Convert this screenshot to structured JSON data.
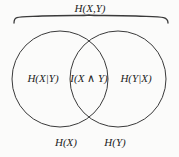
{
  "figure": {
    "type": "venn-diagram",
    "topic": "information-theory-entropy",
    "background_color": "#fbfbfa",
    "stroke_color": "#3a3a3a",
    "text_color": "#1d1d1d"
  },
  "labels": {
    "joint_entropy": "H(X,Y)",
    "conditional_x_given_y": "H(X|Y)",
    "mutual_information": "I(X ∧ Y)",
    "conditional_y_given_x": "H(Y|X)",
    "entropy_x": "H(X)",
    "entropy_y": "H(Y)"
  },
  "geometry": {
    "left_circle": {
      "cx": 60,
      "cy": 79,
      "r": 48
    },
    "right_circle": {
      "cx": 118,
      "cy": 79,
      "r": 48
    },
    "brace": {
      "left_x": 14,
      "right_x": 168,
      "baseline_y": 23,
      "peak_y": 15
    }
  }
}
